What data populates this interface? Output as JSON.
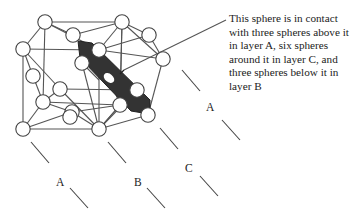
{
  "diagram": {
    "type": "crystal-structure",
    "caption": "This sphere is in contact with three spheres above it in layer A, six spheres around it in layer C, and three spheres below it in layer B",
    "layer_labels": [
      {
        "label": "A",
        "x": 56,
        "y": 176
      },
      {
        "label": "B",
        "x": 134,
        "y": 176
      },
      {
        "label": "C",
        "x": 185,
        "y": 162
      },
      {
        "label": "A",
        "x": 206,
        "y": 101
      }
    ],
    "colors": {
      "line": "#555555",
      "sphere_fill": "#ffffff",
      "highlight_plane": "#333333",
      "text": "#222222"
    },
    "spheres": [
      [
        45,
        22
      ],
      [
        122,
        22
      ],
      [
        23,
        49
      ],
      [
        73,
        35
      ],
      [
        99,
        50
      ],
      [
        149,
        35
      ],
      [
        163,
        59
      ],
      [
        82,
        63
      ],
      [
        33,
        76
      ],
      [
        60,
        89
      ],
      [
        43,
        102
      ],
      [
        137,
        90
      ],
      [
        120,
        105
      ],
      [
        72,
        112
      ],
      [
        23,
        129
      ],
      [
        99,
        129
      ],
      [
        148,
        115
      ],
      [
        70,
        117
      ]
    ],
    "plane_dashes": [
      [
        [
          31,
          142
        ],
        [
          49,
          163
        ]
      ],
      [
        [
          70,
          188
        ],
        [
          88,
          208
        ]
      ],
      [
        [
          108,
          142
        ],
        [
          126,
          163
        ]
      ],
      [
        [
          147,
          188
        ],
        [
          165,
          208
        ]
      ],
      [
        [
          160,
          128
        ],
        [
          178,
          149
        ]
      ],
      [
        [
          200,
          176
        ],
        [
          218,
          196
        ]
      ],
      [
        [
          182,
          70
        ],
        [
          200,
          91
        ]
      ],
      [
        [
          222,
          120
        ],
        [
          240,
          140
        ]
      ]
    ]
  }
}
